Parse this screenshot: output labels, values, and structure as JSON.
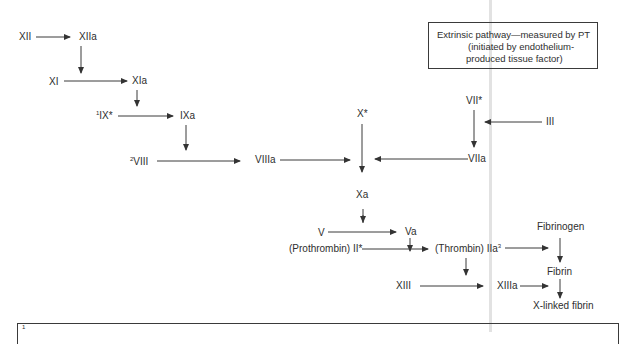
{
  "diagram": {
    "nodes": {
      "xii": {
        "label": "XII"
      },
      "xiia": {
        "label": "XIIa"
      },
      "xi": {
        "label": "XI"
      },
      "xia": {
        "label": "XIa"
      },
      "ix": {
        "sup": "1",
        "label": "IX*"
      },
      "ixa": {
        "label": "IXa"
      },
      "viii": {
        "sup": "2",
        "label": "VIII"
      },
      "viiia": {
        "label": "VIIIa"
      },
      "x": {
        "label": "X*"
      },
      "xa": {
        "label": "Xa"
      },
      "v": {
        "label": "V"
      },
      "va": {
        "label": "Va"
      },
      "prothrombin": {
        "label": "(Prothrombin) II*"
      },
      "thrombin": {
        "label": "(Thrombin) IIa",
        "sup": "3"
      },
      "vii": {
        "label": "VII*"
      },
      "viia": {
        "label": "VIIa"
      },
      "iii": {
        "label": "III"
      },
      "fibrinogen": {
        "label": "Fibrinogen"
      },
      "fibrin": {
        "label": "Fibrin"
      },
      "xiii": {
        "label": "XIII"
      },
      "xiiia": {
        "label": "XIIIa"
      },
      "xlinked": {
        "label": "X-linked fibrin"
      }
    },
    "extrinsic_box": {
      "line1": "Extrinsic pathway—measured by PT",
      "line2": "(initiated by endothelium-",
      "line3": "produced tissue factor)"
    },
    "footnote_box": {
      "marker": "1"
    },
    "edges": [
      [
        "XII",
        "XIIa"
      ],
      [
        "XIIa",
        "XI→XIa"
      ],
      [
        "XI",
        "XIa"
      ],
      [
        "XIa",
        "IX→IXa"
      ],
      [
        "IX",
        "IXa"
      ],
      [
        "IXa",
        "VIII→VIIIa"
      ],
      [
        "VIII",
        "VIIIa"
      ],
      [
        "VIIIa",
        "X→Xa"
      ],
      [
        "X",
        "Xa"
      ],
      [
        "VII",
        "VIIa"
      ],
      [
        "III",
        "VII→VIIa"
      ],
      [
        "VIIa",
        "X→Xa"
      ],
      [
        "Xa",
        "V→Va"
      ],
      [
        "V",
        "Va"
      ],
      [
        "Va",
        "II→IIa"
      ],
      [
        "II",
        "IIa"
      ],
      [
        "IIa",
        "Fibrinogen→Fibrin"
      ],
      [
        "IIa",
        "XIII→XIIIa"
      ],
      [
        "XIII",
        "XIIIa"
      ],
      [
        "Fibrinogen",
        "Fibrin"
      ],
      [
        "XIIIa",
        "Fibrin→X-linked fibrin"
      ],
      [
        "Fibrin",
        "X-linked fibrin"
      ]
    ]
  }
}
